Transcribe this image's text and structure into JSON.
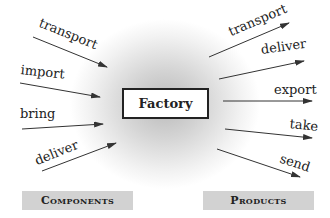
{
  "center": {
    "label": "Factory"
  },
  "inputs": [
    {
      "label": "transport",
      "x1": 33,
      "y1": 37,
      "x2": 107,
      "y2": 67
    },
    {
      "label": "import",
      "x1": 20,
      "y1": 83,
      "x2": 100,
      "y2": 97
    },
    {
      "label": "bring",
      "x1": 22,
      "y1": 129,
      "x2": 103,
      "y2": 124
    },
    {
      "label": "deliver",
      "x1": 42,
      "y1": 171,
      "x2": 116,
      "y2": 143
    }
  ],
  "outputs": [
    {
      "label": "transport",
      "x1": 209,
      "y1": 57,
      "x2": 289,
      "y2": 23
    },
    {
      "label": "deliver",
      "x1": 219,
      "y1": 79,
      "x2": 304,
      "y2": 61
    },
    {
      "label": "export",
      "x1": 223,
      "y1": 101,
      "x2": 312,
      "y2": 101
    },
    {
      "label": "take",
      "x1": 225,
      "y1": 129,
      "x2": 312,
      "y2": 138
    },
    {
      "label": "send",
      "x1": 217,
      "y1": 149,
      "x2": 300,
      "y2": 177
    }
  ],
  "categories": {
    "left": "Components",
    "right": "Products"
  },
  "colors": {
    "arrow": "#333333",
    "category_bg": "#d2d2d2",
    "box_border": "#222222"
  }
}
